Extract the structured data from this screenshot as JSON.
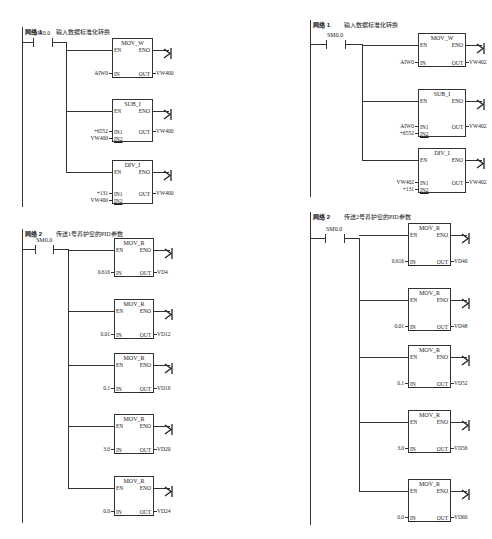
{
  "panels": [
    {
      "id": "left",
      "networks": [
        {
          "label": "网络 1",
          "comment": "输入数据标准化转换",
          "contact": "SM0.0",
          "blocks": [
            {
              "name": "MOV_W",
              "en": "EN",
              "eno": "ENO",
              "inputs": [
                {
                  "pin": "IN",
                  "operand": "AIW0"
                }
              ],
              "out_pin": "OUT",
              "out": "VW400"
            },
            {
              "name": "SUB_I",
              "en": "EN",
              "eno": "ENO",
              "inputs": [
                {
                  "pin": "IN1",
                  "operand": "+6552"
                },
                {
                  "pin": "IN2",
                  "operand": "VW400"
                }
              ],
              "out_pin": "OUT",
              "out": "VW400"
            },
            {
              "name": "DIV_I",
              "en": "EN",
              "eno": "ENO",
              "inputs": [
                {
                  "pin": "IN1",
                  "operand": "+131"
                },
                {
                  "pin": "IN2",
                  "operand": "VW400"
                }
              ],
              "out_pin": "OUT",
              "out": "VW400"
            }
          ]
        },
        {
          "label": "网络 2",
          "comment": "传送1号养护窑的PID参数",
          "contact": "SM0.0",
          "blocks": [
            {
              "name": "MOV_R",
              "en": "EN",
              "eno": "ENO",
              "inputs": [
                {
                  "pin": "IN",
                  "operand": "0.616"
                }
              ],
              "out_pin": "OUT",
              "out": "VD4"
            },
            {
              "name": "MOV_R",
              "en": "EN",
              "eno": "ENO",
              "inputs": [
                {
                  "pin": "IN",
                  "operand": "0.01"
                }
              ],
              "out_pin": "OUT",
              "out": "VD12"
            },
            {
              "name": "MOV_R",
              "en": "EN",
              "eno": "ENO",
              "inputs": [
                {
                  "pin": "IN",
                  "operand": "0.1"
                }
              ],
              "out_pin": "OUT",
              "out": "VD16"
            },
            {
              "name": "MOV_R",
              "en": "EN",
              "eno": "ENO",
              "inputs": [
                {
                  "pin": "IN",
                  "operand": "3.0"
                }
              ],
              "out_pin": "OUT",
              "out": "VD20"
            },
            {
              "name": "MOV_R",
              "en": "EN",
              "eno": "ENO",
              "inputs": [
                {
                  "pin": "IN",
                  "operand": "0.0"
                }
              ],
              "out_pin": "OUT",
              "out": "VD24"
            }
          ]
        }
      ]
    },
    {
      "id": "right",
      "networks": [
        {
          "label": "网络 1",
          "comment": "输入数据标准化转换",
          "contact": "SM0.0",
          "blocks": [
            {
              "name": "MOV_W",
              "en": "EN",
              "eno": "ENO",
              "inputs": [
                {
                  "pin": "IN",
                  "operand": "AIW0"
                }
              ],
              "out_pin": "OUT",
              "out": "VW402"
            },
            {
              "name": "SUB_I",
              "en": "EN",
              "eno": "ENO",
              "inputs": [
                {
                  "pin": "IN1",
                  "operand": "AIW0"
                },
                {
                  "pin": "IN2",
                  "operand": "+6552"
                }
              ],
              "out_pin": "OUT",
              "out": "VW402"
            },
            {
              "name": "DIV_I",
              "en": "EN",
              "eno": "ENO",
              "inputs": [
                {
                  "pin": "IN1",
                  "operand": "VW402"
                },
                {
                  "pin": "IN2",
                  "operand": "+131"
                }
              ],
              "out_pin": "OUT",
              "out": "VW402"
            }
          ]
        },
        {
          "label": "网络 2",
          "comment": "传送2号养护窑的PID参数",
          "contact": "SM0.0",
          "blocks": [
            {
              "name": "MOV_R",
              "en": "EN",
              "eno": "ENO",
              "inputs": [
                {
                  "pin": "IN",
                  "operand": "0.616"
                }
              ],
              "out_pin": "OUT",
              "out": "VD40"
            },
            {
              "name": "MOV_R",
              "en": "EN",
              "eno": "ENO",
              "inputs": [
                {
                  "pin": "IN",
                  "operand": "0.01"
                }
              ],
              "out_pin": "OUT",
              "out": "VD48"
            },
            {
              "name": "MOV_R",
              "en": "EN",
              "eno": "ENO",
              "inputs": [
                {
                  "pin": "IN",
                  "operand": "0.1"
                }
              ],
              "out_pin": "OUT",
              "out": "VD52"
            },
            {
              "name": "MOV_R",
              "en": "EN",
              "eno": "ENO",
              "inputs": [
                {
                  "pin": "IN",
                  "operand": "3.0"
                }
              ],
              "out_pin": "OUT",
              "out": "VD56"
            },
            {
              "name": "MOV_R",
              "en": "EN",
              "eno": "ENO",
              "inputs": [
                {
                  "pin": "IN",
                  "operand": "0.0"
                }
              ],
              "out_pin": "OUT",
              "out": "VD60"
            }
          ]
        }
      ]
    }
  ],
  "icons": {
    "coil_glyph": "⟩|",
    "arrow_glyph": "→"
  }
}
